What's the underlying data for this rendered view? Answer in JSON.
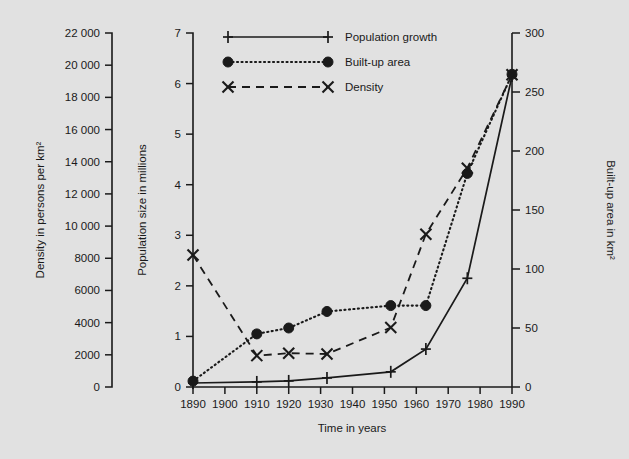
{
  "chart_data": {
    "type": "line",
    "title": "",
    "xlabel": "Time in years",
    "ylabel_left": "Density in persons per km²",
    "ylabel_center": "Population size in millions",
    "ylabel_right": "Built-up area in km²",
    "grid": false,
    "legend_position": "top-center",
    "xlim": [
      1890,
      1990
    ],
    "xticks": [
      1890,
      1900,
      1910,
      1920,
      1930,
      1940,
      1950,
      1960,
      1970,
      1980,
      1990
    ],
    "xtick_labels": [
      "1890",
      "1900",
      "1910",
      "1920",
      "1930",
      "1940",
      "1950",
      "1960",
      "1970",
      "1980",
      "1990"
    ],
    "ylim_left": [
      0,
      22000
    ],
    "yticks_left": [
      0,
      2000,
      4000,
      6000,
      8000,
      10000,
      12000,
      14000,
      16000,
      18000,
      20000,
      22000
    ],
    "ytick_labels_left": [
      "0",
      "2000",
      "4000",
      "6000",
      "8000",
      "10 000",
      "12 000",
      "14 000",
      "16 000",
      "18 000",
      "20 000",
      "22 000"
    ],
    "ylim_center": [
      0,
      7
    ],
    "yticks_center": [
      0,
      1,
      2,
      3,
      4,
      5,
      6,
      7
    ],
    "ytick_labels_center": [
      "0",
      "1",
      "2",
      "3",
      "4",
      "5",
      "6",
      "7"
    ],
    "ylim_right": [
      0,
      300
    ],
    "yticks_right": [
      0,
      50,
      100,
      150,
      200,
      250,
      300
    ],
    "ytick_labels_right": [
      "0",
      "50",
      "100",
      "150",
      "200",
      "250",
      "300"
    ],
    "series": [
      {
        "name": "Population growth",
        "marker": "plus",
        "linestyle": "solid",
        "axis": "center",
        "units": "millions",
        "x": [
          1890,
          1910,
          1920,
          1932,
          1952,
          1963,
          1976,
          1990
        ],
        "values": [
          0.08,
          0.1,
          0.12,
          0.18,
          0.3,
          0.75,
          2.15,
          6.15
        ]
      },
      {
        "name": "Built-up area",
        "marker": "circle",
        "linestyle": "dotted",
        "axis": "right",
        "units": "km²",
        "x": [
          1890,
          1910,
          1920,
          1932,
          1952,
          1963,
          1976,
          1990
        ],
        "values": [
          5,
          45,
          50,
          64,
          69,
          69,
          181,
          265
        ]
      },
      {
        "name": "Density",
        "marker": "x",
        "linestyle": "dashed",
        "axis": "left",
        "units": "persons per km²",
        "x": [
          1890,
          1910,
          1920,
          1932,
          1952,
          1963,
          1976,
          1990
        ],
        "values": [
          8200,
          1950,
          2100,
          2050,
          3700,
          9500,
          13600,
          19400
        ]
      }
    ],
    "legend": [
      {
        "label": "Population growth",
        "marker": "plus",
        "linestyle": "solid"
      },
      {
        "label": "Built-up area",
        "marker": "circle",
        "linestyle": "dotted"
      },
      {
        "label": "Density",
        "marker": "x",
        "linestyle": "dashed"
      }
    ]
  }
}
